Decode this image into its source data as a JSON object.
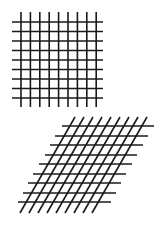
{
  "figure": {
    "line_color": "#1a1a1a",
    "background": "#ffffff",
    "square_grid": {
      "vertical_lines": {
        "count": 9,
        "x_start": 21,
        "x_step": 9.4,
        "y_top": 12,
        "y_bottom": 107
      },
      "horizontal_lines": {
        "count": 9,
        "y_start": 22,
        "y_step": 9.5,
        "x_left": 12,
        "x_right": 103
      }
    },
    "sheared_grid": {
      "horizontal_lines": [
        {
          "y": 126,
          "x1": 62,
          "x2": 154
        },
        {
          "y": 136,
          "x1": 55,
          "x2": 148
        },
        {
          "y": 145,
          "x1": 50,
          "x2": 143
        },
        {
          "y": 155,
          "x1": 45,
          "x2": 137
        },
        {
          "y": 164,
          "x1": 39,
          "x2": 132
        },
        {
          "y": 174,
          "x1": 33,
          "x2": 126
        },
        {
          "y": 183,
          "x1": 28,
          "x2": 121
        },
        {
          "y": 193,
          "x1": 23,
          "x2": 116
        },
        {
          "y": 202,
          "x1": 18,
          "x2": 111
        }
      ],
      "slanted_lines": {
        "count": 9,
        "top_x_start": 75,
        "top_y": 117,
        "bottom_x_start": 20,
        "bottom_y": 213,
        "x_step": 9
      }
    }
  }
}
